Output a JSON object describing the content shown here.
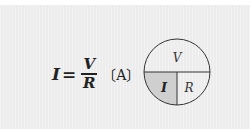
{
  "formula": {
    "lhs": "I",
    "equals": "=",
    "numerator": "V",
    "denominator": "R",
    "unit": "〔A〕"
  },
  "diagram": {
    "top_label": "V",
    "bottom_left_label": "I",
    "bottom_right_label": "R",
    "highlighted_segment": "I",
    "colors": {
      "background": "#ececec",
      "circle_fill": "#ffffff",
      "highlight_fill": "#cfcfcf",
      "stroke": "#333333"
    }
  }
}
